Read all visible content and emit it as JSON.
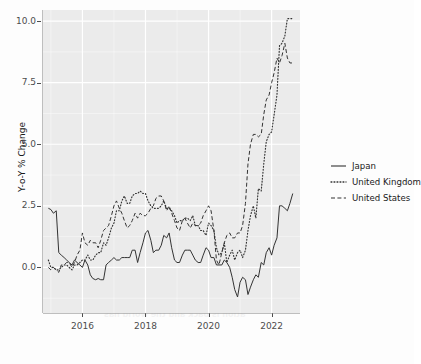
{
  "figure": {
    "background_color": "#fdfdfd",
    "panel_color": "#ebebeb",
    "grid_color": "#ffffff",
    "axis_text_color": "#4d4d4d"
  },
  "background_artifact": {
    "note": "faint mirrored bleed-through text from reverse of scanned page",
    "lines": [
      "ner to Inflation",
      "e on rates, we sense that the market",
      "will expect the Fed to over-tighten",
      "this year and then have to ease",
      "sooner to Deflation",
      "ation is back and the world has"
    ]
  },
  "chart_data": {
    "type": "line",
    "title": "",
    "xlabel": "",
    "ylabel": "Y-o-Y % Change",
    "xlim": [
      2014.75,
      2022.9
    ],
    "ylim": [
      -1.85,
      10.45
    ],
    "yticks": [
      0.0,
      2.5,
      5.0,
      7.5,
      10.0
    ],
    "ytick_labels": [
      "0.0",
      "2.5",
      "5.0",
      "7.5",
      "10.0"
    ],
    "xticks": [
      2016,
      2018,
      2020,
      2022
    ],
    "xtick_labels": [
      "2016",
      "2018",
      "2020",
      "2022"
    ],
    "grid": true,
    "legend_position": "right",
    "x": [
      2014.92,
      2015.0,
      2015.08,
      2015.17,
      2015.25,
      2015.33,
      2015.42,
      2015.5,
      2015.58,
      2015.67,
      2015.75,
      2015.83,
      2015.92,
      2016.0,
      2016.08,
      2016.17,
      2016.25,
      2016.33,
      2016.42,
      2016.5,
      2016.58,
      2016.67,
      2016.75,
      2016.83,
      2016.92,
      2017.0,
      2017.08,
      2017.17,
      2017.25,
      2017.33,
      2017.42,
      2017.5,
      2017.58,
      2017.67,
      2017.75,
      2017.83,
      2017.92,
      2018.0,
      2018.08,
      2018.17,
      2018.25,
      2018.33,
      2018.42,
      2018.5,
      2018.58,
      2018.67,
      2018.75,
      2018.83,
      2018.92,
      2019.0,
      2019.08,
      2019.17,
      2019.25,
      2019.33,
      2019.42,
      2019.5,
      2019.58,
      2019.67,
      2019.75,
      2019.83,
      2019.92,
      2020.0,
      2020.08,
      2020.17,
      2020.25,
      2020.33,
      2020.42,
      2020.5,
      2020.58,
      2020.67,
      2020.75,
      2020.83,
      2020.92,
      2021.0,
      2021.08,
      2021.17,
      2021.25,
      2021.33,
      2021.42,
      2021.5,
      2021.58,
      2021.67,
      2021.75,
      2021.83,
      2021.92,
      2022.0,
      2022.08,
      2022.17,
      2022.25,
      2022.33,
      2022.42,
      2022.5,
      2022.58,
      2022.67
    ],
    "series": [
      {
        "name": "Japan",
        "dash": "solid",
        "color": "#333333",
        "values": [
          2.4,
          2.35,
          2.2,
          2.3,
          0.6,
          0.5,
          0.4,
          0.3,
          0.2,
          0.1,
          0.3,
          0.2,
          0.1,
          0.0,
          0.3,
          0.1,
          -0.3,
          -0.45,
          -0.5,
          -0.45,
          -0.5,
          -0.5,
          0.1,
          0.2,
          0.3,
          0.4,
          0.3,
          0.3,
          0.4,
          0.4,
          0.4,
          0.4,
          0.7,
          0.7,
          0.2,
          0.6,
          1.0,
          1.4,
          1.5,
          1.1,
          0.6,
          0.7,
          0.7,
          0.9,
          1.3,
          1.2,
          1.4,
          0.8,
          0.3,
          0.2,
          0.2,
          0.5,
          0.7,
          0.7,
          0.7,
          0.5,
          0.3,
          0.2,
          0.2,
          0.5,
          0.8,
          0.7,
          0.4,
          0.4,
          0.1,
          0.1,
          0.1,
          0.3,
          0.2,
          0.0,
          -0.4,
          -0.9,
          -1.2,
          -0.6,
          -0.4,
          -0.5,
          -1.1,
          -0.8,
          -0.5,
          -0.3,
          -0.4,
          0.2,
          0.1,
          0.6,
          0.8,
          0.5,
          0.9,
          1.2,
          2.5,
          2.5,
          2.4,
          2.3,
          2.6,
          3.0
        ]
      },
      {
        "name": "United Kingdom",
        "dash": "dotted",
        "color": "#333333",
        "values": [
          0.3,
          0.0,
          0.0,
          -0.1,
          -0.1,
          0.0,
          0.1,
          0.1,
          0.0,
          -0.1,
          0.1,
          0.1,
          0.2,
          0.3,
          0.3,
          0.5,
          0.3,
          0.3,
          0.5,
          0.6,
          0.6,
          1.0,
          0.9,
          1.2,
          1.6,
          1.8,
          2.3,
          2.3,
          2.7,
          2.9,
          2.6,
          2.6,
          2.9,
          3.0,
          3.0,
          3.1,
          3.0,
          3.0,
          2.7,
          2.5,
          2.4,
          2.4,
          2.4,
          2.5,
          2.7,
          2.4,
          2.4,
          2.3,
          2.1,
          1.8,
          1.9,
          1.9,
          2.0,
          2.0,
          1.9,
          2.1,
          1.7,
          1.7,
          1.5,
          1.5,
          1.3,
          1.8,
          1.7,
          1.5,
          0.8,
          0.5,
          0.6,
          1.0,
          0.2,
          0.5,
          0.7,
          0.3,
          0.6,
          0.7,
          0.4,
          0.7,
          1.5,
          2.1,
          2.5,
          2.0,
          3.2,
          3.1,
          4.2,
          5.1,
          5.4,
          5.5,
          6.2,
          7.0,
          9.0,
          9.1,
          9.4,
          10.1,
          10.1,
          10.1
        ]
      },
      {
        "name": "United States",
        "dash": "dashed",
        "color": "#333333",
        "values": [
          0.0,
          -0.1,
          0.0,
          -0.1,
          -0.2,
          0.1,
          0.1,
          0.2,
          0.2,
          0.0,
          0.2,
          0.5,
          0.7,
          1.4,
          1.0,
          0.9,
          1.1,
          1.0,
          1.0,
          0.8,
          1.1,
          1.5,
          1.6,
          1.7,
          2.1,
          2.5,
          2.7,
          2.4,
          2.2,
          1.9,
          1.6,
          1.7,
          1.9,
          2.2,
          2.0,
          2.2,
          2.1,
          2.1,
          2.2,
          2.4,
          2.5,
          2.8,
          2.9,
          2.9,
          2.7,
          2.3,
          2.5,
          2.2,
          1.9,
          1.6,
          1.5,
          1.9,
          2.0,
          1.8,
          1.6,
          1.8,
          1.7,
          1.7,
          1.8,
          2.1,
          2.3,
          2.5,
          2.3,
          1.5,
          0.3,
          0.1,
          0.6,
          1.0,
          1.3,
          1.4,
          1.2,
          1.2,
          1.4,
          1.4,
          1.7,
          2.6,
          4.2,
          5.0,
          5.4,
          5.4,
          5.3,
          5.4,
          6.2,
          6.8,
          7.0,
          7.5,
          7.9,
          8.5,
          8.3,
          8.6,
          9.1,
          8.5,
          8.3,
          8.3
        ]
      }
    ]
  },
  "legend": {
    "items": [
      {
        "label": "Japan",
        "style": "solid"
      },
      {
        "label": "United Kingdom",
        "style": "dotted"
      },
      {
        "label": "United States",
        "style": "dashed"
      }
    ]
  }
}
